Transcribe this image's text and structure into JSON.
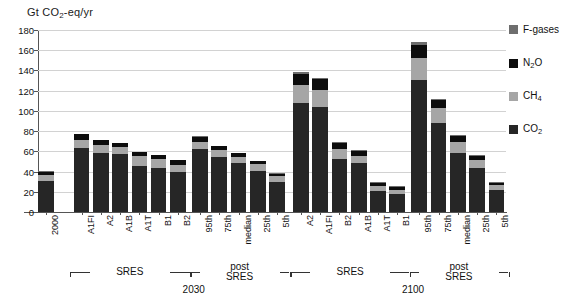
{
  "chart_data": {
    "type": "bar",
    "stacked": true,
    "title": "Gt CO2-eq/yr",
    "ylabel": "Gt CO2-eq/yr",
    "xlabel": "",
    "ylim": [
      0,
      180
    ],
    "ytick_values": [
      0,
      20,
      40,
      60,
      80,
      100,
      120,
      140,
      160,
      180
    ],
    "grid": true,
    "legend_position": "right",
    "series": [
      {
        "name": "CO2",
        "color": "#262626"
      },
      {
        "name": "CH4",
        "color": "#a6a6a6"
      },
      {
        "name": "N2O",
        "color": "#0d0d0d"
      },
      {
        "name": "F-gases",
        "color": "#6e6e6e"
      }
    ],
    "categories": [
      "2000",
      "A1FI",
      "A2",
      "A1B",
      "A1T",
      "B1",
      "B2",
      "95th",
      "75th",
      "median",
      "25th",
      "5th",
      "A2",
      "A1FI",
      "B2",
      "A1B",
      "A1T",
      "B1",
      "95th",
      "75th",
      "median",
      "25th",
      "5th"
    ],
    "bars": [
      {
        "label": "2000",
        "group": "base",
        "co2": 31,
        "ch4": 6,
        "n2o": 3,
        "fgas": 0.5,
        "total": 40.5
      },
      {
        "label": "A1FI",
        "group": "sres2030",
        "co2": 63,
        "ch4": 8,
        "n2o": 6,
        "fgas": 0.5,
        "total": 77.5
      },
      {
        "label": "A2",
        "group": "sres2030",
        "co2": 58,
        "ch4": 8,
        "n2o": 5,
        "fgas": 0.5,
        "total": 71.5
      },
      {
        "label": "A1B",
        "group": "sres2030",
        "co2": 57,
        "ch4": 7,
        "n2o": 4,
        "fgas": 0.5,
        "total": 68.5
      },
      {
        "label": "A1T",
        "group": "sres2030",
        "co2": 46,
        "ch4": 9,
        "n2o": 4,
        "fgas": 0.5,
        "total": 59.5
      },
      {
        "label": "B1",
        "group": "sres2030",
        "co2": 44,
        "ch4": 8,
        "n2o": 4,
        "fgas": 0.5,
        "total": 56.5
      },
      {
        "label": "B2",
        "group": "sres2030",
        "co2": 40,
        "ch4": 7,
        "n2o": 4,
        "fgas": 0.5,
        "total": 51.5
      },
      {
        "label": "95th",
        "group": "post2030",
        "co2": 62,
        "ch4": 7,
        "n2o": 5,
        "fgas": 1,
        "total": 75
      },
      {
        "label": "75th",
        "group": "post2030",
        "co2": 54,
        "ch4": 7,
        "n2o": 4,
        "fgas": 0.5,
        "total": 65.5
      },
      {
        "label": "median",
        "group": "post2030",
        "co2": 48,
        "ch4": 6,
        "n2o": 4,
        "fgas": 0.5,
        "total": 58.5
      },
      {
        "label": "25th",
        "group": "post2030",
        "co2": 41,
        "ch4": 6,
        "n2o": 3,
        "fgas": 0.5,
        "total": 50.5
      },
      {
        "label": "5th",
        "group": "post2030",
        "co2": 30,
        "ch4": 6,
        "n2o": 2,
        "fgas": 0.5,
        "total": 38.5
      },
      {
        "label": "A2",
        "group": "sres2100",
        "co2": 108,
        "ch4": 18,
        "n2o": 11,
        "fgas": 2,
        "total": 139
      },
      {
        "label": "A1FI",
        "group": "sres2100",
        "co2": 104,
        "ch4": 17,
        "n2o": 11,
        "fgas": 1,
        "total": 133
      },
      {
        "label": "B2",
        "group": "sres2100",
        "co2": 52,
        "ch4": 10,
        "n2o": 6,
        "fgas": 1,
        "total": 69
      },
      {
        "label": "A1B",
        "group": "sres2100",
        "co2": 48,
        "ch4": 7,
        "n2o": 5,
        "fgas": 1,
        "total": 61
      },
      {
        "label": "A1T",
        "group": "sres2100",
        "co2": 21,
        "ch4": 5,
        "n2o": 3,
        "fgas": 1,
        "total": 30
      },
      {
        "label": "B1",
        "group": "sres2100",
        "co2": 18,
        "ch4": 4,
        "n2o": 3,
        "fgas": 1,
        "total": 26
      },
      {
        "label": "95th",
        "group": "post2100",
        "co2": 131,
        "ch4": 21,
        "n2o": 13,
        "fgas": 3,
        "total": 168
      },
      {
        "label": "75th",
        "group": "post2100",
        "co2": 88,
        "ch4": 15,
        "n2o": 8,
        "fgas": 1,
        "total": 112
      },
      {
        "label": "median",
        "group": "post2100",
        "co2": 58,
        "ch4": 11,
        "n2o": 6,
        "fgas": 1,
        "total": 76
      },
      {
        "label": "25th",
        "group": "post2100",
        "co2": 44,
        "ch4": 7,
        "n2o": 4,
        "fgas": 1,
        "total": 56
      },
      {
        "label": "5th",
        "group": "post2100",
        "co2": 22,
        "ch4": 5,
        "n2o": 2,
        "fgas": 0.5,
        "total": 29.5
      }
    ],
    "annotations": {
      "groups": [
        {
          "name": "sres-2030",
          "label": "SRES",
          "year": "2030"
        },
        {
          "name": "post-sres-2030",
          "label": "post\nSRES",
          "year": "2030"
        },
        {
          "name": "sres-2100",
          "label": "SRES",
          "year": "2100"
        },
        {
          "name": "post-sres-2100",
          "label": "post\nSRES",
          "year": "2100"
        }
      ],
      "sres_label": "SRES",
      "post_sres_label_line1": "post",
      "post_sres_label_line2": "SRES",
      "year_2030": "2030",
      "year_2100": "2100"
    },
    "legend": [
      {
        "key": "fgas",
        "label": "F-gases",
        "color": "#6e6e6e"
      },
      {
        "key": "n2o",
        "label": "N2O",
        "color": "#0d0d0d"
      },
      {
        "key": "ch4",
        "label": "CH4",
        "color": "#a6a6a6"
      },
      {
        "key": "co2",
        "label": "CO2",
        "color": "#262626"
      }
    ]
  },
  "axis": {
    "title_prefix": "Gt CO",
    "title_sub": "2",
    "title_suffix": "-eq/yr"
  },
  "legend_labels": {
    "fgases": "F-gases",
    "n2o_pre": "N",
    "n2o_sub": "2",
    "n2o_post": "O",
    "ch4_pre": "CH",
    "ch4_sub": "4",
    "co2_pre": "CO",
    "co2_sub": "2"
  }
}
